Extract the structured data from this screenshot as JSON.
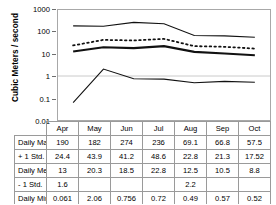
{
  "axis": {
    "y_title": "Cubic Meters / second",
    "y_ticks": [
      "1000",
      "100",
      "10",
      "1",
      "0.1",
      "0.01"
    ]
  },
  "chart_data": {
    "type": "line",
    "title": "",
    "xlabel": "",
    "ylabel": "Cubic Meters / second",
    "yscale": "log",
    "ylim": [
      0.01,
      1000
    ],
    "grid": "horizontal-light",
    "legend": "none",
    "categories": [
      "Apr",
      "May",
      "Jun",
      "Jul",
      "Aug",
      "Sep",
      "Oct"
    ],
    "series": [
      {
        "name": "Daily Max",
        "style": "solid-thin",
        "values": [
          190,
          182,
          274,
          236,
          69.1,
          66.8,
          57.5
        ]
      },
      {
        "name": "+ 1 Std.",
        "style": "dotted",
        "values": [
          24.4,
          43.9,
          41.2,
          48.6,
          22.8,
          21.3,
          17.52
        ]
      },
      {
        "name": "Daily Mean",
        "style": "solid-thick",
        "values": [
          13,
          20.3,
          18.5,
          22.8,
          12.5,
          10.5,
          8.8
        ]
      },
      {
        "name": "- 1 Std.",
        "style": "none",
        "values": [
          1.6,
          null,
          null,
          null,
          2.2,
          null,
          null
        ]
      },
      {
        "name": "Daily Min.",
        "style": "solid-thin",
        "values": [
          0.061,
          2.06,
          0.756,
          0.72,
          0.49,
          0.57,
          0.52
        ]
      }
    ]
  },
  "table": {
    "months": [
      "Apr",
      "May",
      "Jun",
      "Jul",
      "Aug",
      "Sep",
      "Oct"
    ],
    "rows": [
      {
        "label": "Daily Max",
        "values": [
          "190",
          "182",
          "274",
          "236",
          "69.1",
          "66.8",
          "57.5"
        ]
      },
      {
        "label": "+ 1 Std.",
        "values": [
          "24.4",
          "43.9",
          "41.2",
          "48.6",
          "22.8",
          "21.3",
          "17.52"
        ]
      },
      {
        "label": "Daily Mean",
        "values": [
          "13",
          "20.3",
          "18.5",
          "22.8",
          "12.5",
          "10.5",
          "8.8"
        ]
      },
      {
        "label": "- 1 Std.",
        "values": [
          "1.6",
          "",
          "",
          "",
          "2.2",
          "",
          ""
        ]
      },
      {
        "label": "Daily Min.",
        "values": [
          "0.061",
          "2.06",
          "0.756",
          "0.72",
          "0.49",
          "0.57",
          "0.52"
        ]
      }
    ]
  }
}
